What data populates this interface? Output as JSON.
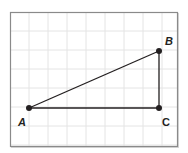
{
  "diagram": {
    "type": "right-triangle-on-grid",
    "grid": {
      "frame": {
        "x": 10,
        "y": 12,
        "width": 167,
        "height": 134
      },
      "cell_size": 19,
      "line_color": "#e4e4e4",
      "border_color": "#8a8a8a"
    },
    "points": [
      {
        "id": "A",
        "label": "A",
        "x": 29,
        "y": 108,
        "label_x": 18,
        "label_y": 126,
        "italic": true
      },
      {
        "id": "B",
        "label": "B",
        "x": 159,
        "y": 51,
        "label_x": 165,
        "label_y": 45,
        "italic": true
      },
      {
        "id": "C",
        "label": "C",
        "x": 159,
        "y": 108,
        "label_x": 162,
        "label_y": 126,
        "italic": false
      }
    ],
    "segments": [
      {
        "from": "A",
        "to": "B"
      },
      {
        "from": "B",
        "to": "C"
      },
      {
        "from": "A",
        "to": "C"
      }
    ],
    "stroke_color": "#231f20"
  }
}
